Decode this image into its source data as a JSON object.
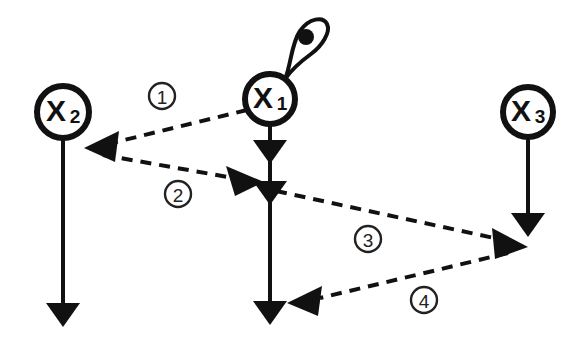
{
  "diagram": {
    "background_color": "#ffffff",
    "ink_color": "#111111",
    "nodes": [
      {
        "id": "x1",
        "label": "X",
        "subscript": "1",
        "cx": 270,
        "cy": 99,
        "r": 25,
        "has_self_loop": true,
        "self_loop_name": "x1-self-loop"
      },
      {
        "id": "x2",
        "label": "X",
        "subscript": "2",
        "cx": 63,
        "cy": 112,
        "r": 26,
        "has_self_loop": false,
        "self_loop_name": ""
      },
      {
        "id": "x3",
        "label": "X",
        "subscript": "3",
        "cx": 528,
        "cy": 112,
        "r": 25,
        "has_self_loop": false,
        "self_loop_name": ""
      }
    ],
    "time_lines": [
      {
        "id": "x1-timeline",
        "x": 270,
        "y_start": 124,
        "y_end": 318,
        "style": "solid",
        "arrowheads_at": [
          155,
          196,
          318
        ]
      },
      {
        "id": "x2-timeline",
        "x": 63,
        "y_start": 138,
        "y_end": 320,
        "style": "solid",
        "arrowheads_at": [
          320
        ]
      },
      {
        "id": "x3-timeline",
        "x": 528,
        "y_start": 137,
        "y_end": 230,
        "style": "solid",
        "arrowheads_at": [
          230
        ]
      }
    ],
    "edges": [
      {
        "id": "edge-1",
        "number": "1",
        "from": "x1",
        "to": "x2",
        "style": "dashed",
        "label_cx": 162,
        "label_cy": 96,
        "label_r": 13
      },
      {
        "id": "edge-2",
        "number": "2",
        "from": "x2",
        "to": "x1",
        "style": "dashed",
        "label_cx": 178,
        "label_cy": 194,
        "label_r": 13
      },
      {
        "id": "edge-3",
        "number": "3",
        "from": "x1",
        "to": "x3",
        "style": "dashed",
        "label_cx": 368,
        "label_cy": 239,
        "label_r": 13
      },
      {
        "id": "edge-4",
        "number": "4",
        "from": "x3",
        "to": "x1",
        "style": "dashed",
        "label_cx": 424,
        "label_cy": 300,
        "label_r": 13
      }
    ]
  }
}
